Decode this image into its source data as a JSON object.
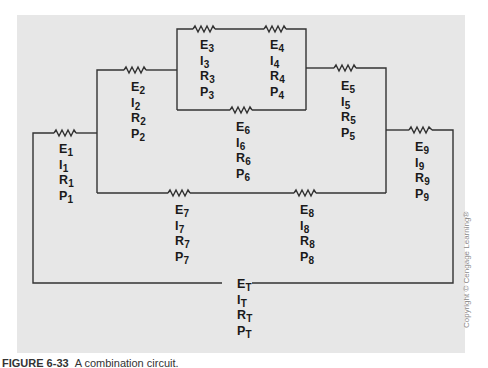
{
  "figure": {
    "caption_label": "FIGURE 6-33",
    "caption_text": "A combination circuit.",
    "copyright": "Copyright © Cengage Learning®"
  },
  "colors": {
    "background": "#ffffff",
    "panel": "#e7e7e7",
    "wire": "#333333",
    "text": "#1a1a1a"
  },
  "components": [
    {
      "id": "R1",
      "symbol": "resistor",
      "labels": [
        "E",
        "I",
        "R",
        "P"
      ],
      "sub": "1"
    },
    {
      "id": "R2",
      "symbol": "resistor",
      "labels": [
        "E",
        "I",
        "R",
        "P"
      ],
      "sub": "2"
    },
    {
      "id": "R3",
      "symbol": "resistor",
      "labels": [
        "E",
        "I",
        "R",
        "P"
      ],
      "sub": "3"
    },
    {
      "id": "R4",
      "symbol": "resistor",
      "labels": [
        "E",
        "I",
        "R",
        "P"
      ],
      "sub": "4"
    },
    {
      "id": "R5",
      "symbol": "resistor",
      "labels": [
        "E",
        "I",
        "R",
        "P"
      ],
      "sub": "5"
    },
    {
      "id": "R6",
      "symbol": "resistor",
      "labels": [
        "E",
        "I",
        "R",
        "P"
      ],
      "sub": "6"
    },
    {
      "id": "R7",
      "symbol": "resistor",
      "labels": [
        "E",
        "I",
        "R",
        "P"
      ],
      "sub": "7"
    },
    {
      "id": "R8",
      "symbol": "resistor",
      "labels": [
        "E",
        "I",
        "R",
        "P"
      ],
      "sub": "8"
    },
    {
      "id": "R9",
      "symbol": "resistor",
      "labels": [
        "E",
        "I",
        "R",
        "P"
      ],
      "sub": "9"
    },
    {
      "id": "Total",
      "symbol": "source-terminal",
      "labels": [
        "E",
        "I",
        "R",
        "P"
      ],
      "sub": "T"
    }
  ]
}
